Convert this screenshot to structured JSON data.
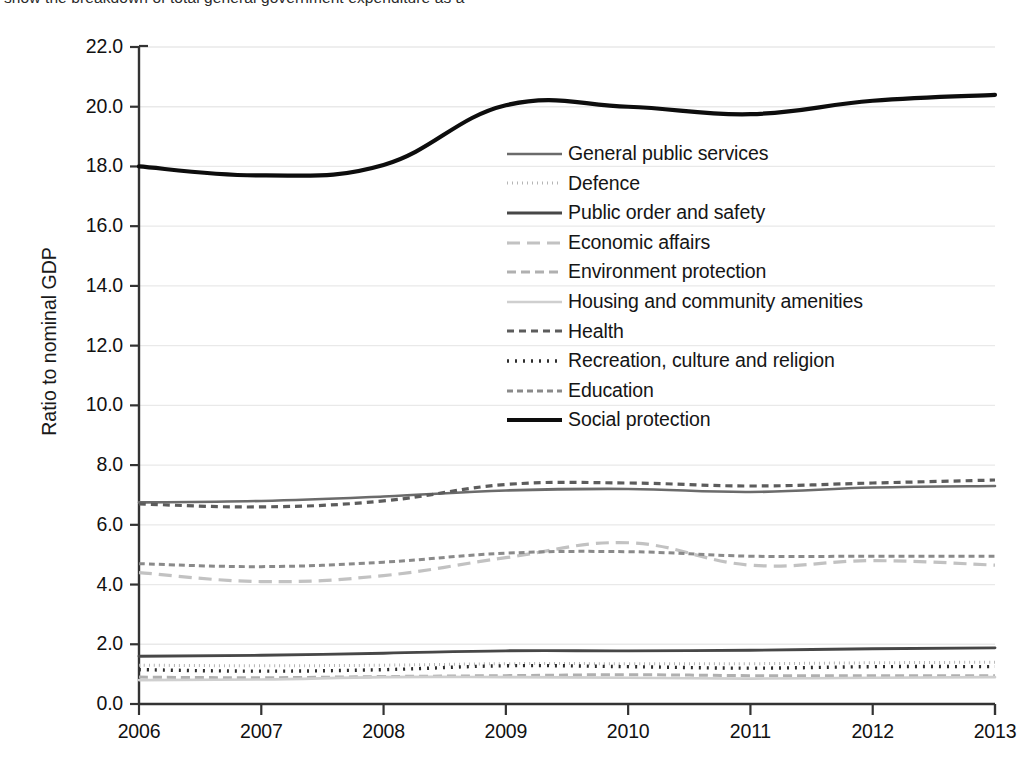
{
  "caption": {
    "text": "show the breakdown of total general government expenditure as a"
  },
  "chart_data": {
    "type": "line",
    "title": "",
    "xlabel": "",
    "ylabel": "Ratio to nominal GDP",
    "x": [
      2006,
      2007,
      2008,
      2009,
      2010,
      2011,
      2012,
      2013
    ],
    "xtick_labels": [
      "2006",
      "2007",
      "2008",
      "2009",
      "2010",
      "2011",
      "2012",
      "2013"
    ],
    "ytick_labels": [
      "0.0",
      "2.0",
      "4.0",
      "6.0",
      "8.0",
      "10.0",
      "12.0",
      "14.0",
      "16.0",
      "18.0",
      "20.0",
      "22.0"
    ],
    "ytick_values": [
      0.0,
      2.0,
      4.0,
      6.0,
      8.0,
      10.0,
      12.0,
      14.0,
      16.0,
      18.0,
      20.0,
      22.0
    ],
    "ylim": [
      0.0,
      22.0
    ],
    "xlim": [
      2006,
      2013
    ],
    "grid": "horizontal",
    "legend_position": "center",
    "series": [
      {
        "name": "General public services",
        "values": [
          6.75,
          6.8,
          6.95,
          7.15,
          7.2,
          7.1,
          7.25,
          7.3
        ],
        "color": "#6b6b6b",
        "dash": "none",
        "width": 2.6
      },
      {
        "name": "Defence",
        "values": [
          1.3,
          1.28,
          1.3,
          1.35,
          1.35,
          1.35,
          1.38,
          1.4
        ],
        "color": "#b5b5b5",
        "dash": "1,4",
        "width": 3.0
      },
      {
        "name": "Public order and safety",
        "values": [
          1.6,
          1.63,
          1.7,
          1.78,
          1.78,
          1.8,
          1.85,
          1.88
        ],
        "color": "#474747",
        "dash": "none",
        "width": 2.9
      },
      {
        "name": "Economic affairs",
        "values": [
          4.4,
          4.1,
          4.3,
          4.9,
          5.4,
          4.65,
          4.8,
          4.65
        ],
        "color": "#c2c2c2",
        "dash": "13,7",
        "width": 3.2
      },
      {
        "name": "Environment protection",
        "values": [
          0.9,
          0.88,
          0.92,
          0.95,
          0.98,
          0.95,
          0.95,
          0.95
        ],
        "color": "#b0b0b0",
        "dash": "9,5",
        "width": 3.0
      },
      {
        "name": "Housing and community amenities",
        "values": [
          0.8,
          0.82,
          0.9,
          0.9,
          0.88,
          0.85,
          0.88,
          0.9
        ],
        "color": "#cfcfcf",
        "dash": "none",
        "width": 2.6
      },
      {
        "name": "Health",
        "values": [
          6.7,
          6.6,
          6.8,
          7.35,
          7.4,
          7.3,
          7.4,
          7.5
        ],
        "color": "#5c5c5c",
        "dash": "7,5",
        "width": 3.2
      },
      {
        "name": "Recreation, culture and religion",
        "values": [
          1.15,
          1.1,
          1.15,
          1.28,
          1.25,
          1.2,
          1.25,
          1.25
        ],
        "color": "#2e2e2e",
        "dash": "2,6",
        "width": 3.4
      },
      {
        "name": "Education",
        "values": [
          4.7,
          4.6,
          4.75,
          5.05,
          5.1,
          4.95,
          4.95,
          4.95
        ],
        "color": "#8a8a8a",
        "dash": "6,4",
        "width": 3.0
      },
      {
        "name": "Social protection",
        "values": [
          18.0,
          17.7,
          18.05,
          20.05,
          20.0,
          19.75,
          20.2,
          20.4
        ],
        "color": "#0d0d0d",
        "dash": "none",
        "width": 4.2
      }
    ]
  },
  "axes": {
    "grid_color": "#e9e9e9",
    "axis_color": "#333333"
  }
}
